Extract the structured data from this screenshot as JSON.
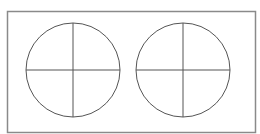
{
  "diagram": {
    "frame": {
      "x": 7.5,
      "y": 11.5,
      "width": 248,
      "height": 121,
      "stroke": "#8a8a8a"
    },
    "line_color": "#555555",
    "circles": [
      {
        "name": "left-circle",
        "cx": 73,
        "cy": 70,
        "r": 47
      },
      {
        "name": "right-circle",
        "cx": 183,
        "cy": 70,
        "r": 47
      }
    ]
  }
}
